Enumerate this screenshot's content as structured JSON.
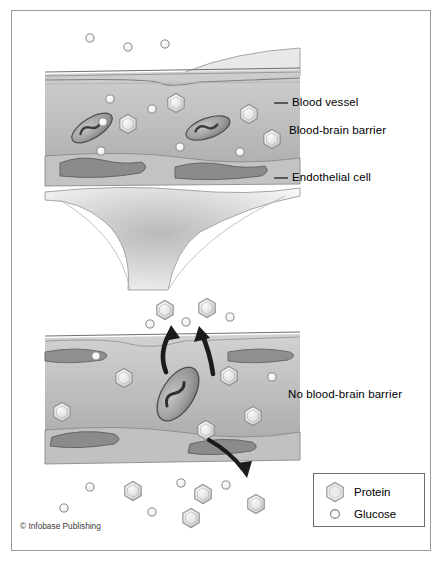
{
  "figure": {
    "credit": "© Infobase Publishing",
    "background": "#ffffff",
    "border_color": "#9a9a9a"
  },
  "labels": {
    "blood_vessel": "Blood vessel",
    "blood_brain_barrier": "Blood-brain barrier",
    "endothelial_cell": "Endothelial cell",
    "no_blood_brain_barrier": "No blood-brain barrier"
  },
  "legend": {
    "items": [
      {
        "symbol": "hexagon",
        "label": "Protein"
      },
      {
        "symbol": "circle",
        "label": "Glucose"
      }
    ]
  },
  "colors": {
    "vessel_fill_light": "#d8d8d8",
    "vessel_fill_mid": "#bdbdbd",
    "vessel_wall": "#c9c9c9",
    "nucleus": "#8c8c8c",
    "rbc_dark": "#6f6f6f",
    "protein_fill": "#e2e2e2",
    "protein_stroke": "#8f8f8f",
    "glucose_fill": "#f2f2f2",
    "glucose_stroke": "#8a8a8a",
    "arrow": "#1b1b1b",
    "astrocyte": "#ededed",
    "outline": "#707070",
    "text": "#000000"
  },
  "panels": {
    "top": {
      "name": "intact-blood-brain-barrier",
      "description": "Blood vessel with tight endothelial junctions; glucose outside, protein retained inside"
    },
    "bottom": {
      "name": "leaky-vessel",
      "description": "Vessel without barrier; protein and glucose escape via arrows"
    }
  },
  "molecules": {
    "top_outside_glucose": 3,
    "top_inside_protein": 4,
    "top_inside_glucose": 6,
    "bottom_escaping": 6,
    "bottom_outside": 9
  }
}
